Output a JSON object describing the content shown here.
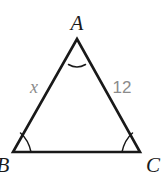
{
  "figure": {
    "type": "geometry-diagram",
    "shape": "triangle",
    "background_color": "#ffffff",
    "stroke_color": "#191919",
    "label_color": "#1a1a1a",
    "measure_label_color": "#8b8b8b",
    "vertices": [
      {
        "name": "vertex-a",
        "label": "A",
        "x": 77,
        "y": 39,
        "label_x": 77,
        "label_y": 30
      },
      {
        "name": "vertex-b",
        "label": "B",
        "x": 13,
        "y": 152,
        "label_x": 4,
        "label_y": 170
      },
      {
        "name": "vertex-c",
        "label": "C",
        "x": 140,
        "y": 152,
        "label_x": 152,
        "label_y": 170
      }
    ],
    "sides": [
      {
        "name": "side-ab",
        "label": "x",
        "from": "B",
        "to": "A",
        "label_x": 34,
        "label_y": 92,
        "italic": true
      },
      {
        "name": "side-ac",
        "label": "12",
        "from": "A",
        "to": "C",
        "label_x": 113,
        "label_y": 92,
        "italic": false
      },
      {
        "name": "side-bc",
        "label": "",
        "from": "B",
        "to": "C",
        "label_x": null,
        "label_y": null,
        "italic": false
      }
    ],
    "angle_marks": [
      {
        "name": "angle-mark-a",
        "vertex": "A"
      },
      {
        "name": "angle-mark-b",
        "vertex": "B"
      },
      {
        "name": "angle-mark-c",
        "vertex": "C"
      }
    ]
  }
}
